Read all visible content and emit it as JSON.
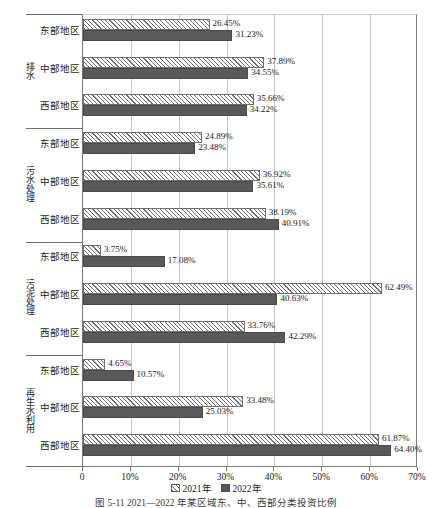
{
  "chart_data": {
    "type": "bar",
    "orientation": "horizontal",
    "title": "",
    "caption": "图 5-11  2021—2022 年某区域东、中、西部分类投资比例",
    "xlabel": "",
    "ylabel": "",
    "xlim": [
      0,
      70
    ],
    "xticks": [
      0,
      10,
      20,
      30,
      40,
      50,
      60,
      70
    ],
    "xtick_labels": [
      "0",
      "10%",
      "20%",
      "30%",
      "40%",
      "50%",
      "60%",
      "70%"
    ],
    "grid": true,
    "grid_axis": "x",
    "legend_position": "bottom",
    "legend": [
      "2021年",
      "2022年"
    ],
    "series": [
      {
        "name": "2021年",
        "fill": "hatched",
        "color": "#ffffff",
        "edge": "#6e6e6e"
      },
      {
        "name": "2022年",
        "fill": "solid",
        "color": "#595959",
        "edge": "#4a4a4a"
      }
    ],
    "groups": [
      {
        "label": "排水",
        "categories": [
          "东部地区",
          "中部地区",
          "西部地区"
        ],
        "values_2021": [
          26.45,
          37.89,
          35.66
        ],
        "values_2022": [
          31.23,
          34.55,
          34.22
        ],
        "labels_2021": [
          "26.45%",
          "37.89%",
          "35.66%"
        ],
        "labels_2022": [
          "31.23%",
          "34.55%",
          "34.22%"
        ]
      },
      {
        "label": "污水处理",
        "categories": [
          "东部地区",
          "中部地区",
          "西部地区"
        ],
        "values_2021": [
          24.89,
          36.92,
          38.19
        ],
        "values_2022": [
          23.48,
          35.61,
          40.91
        ],
        "labels_2021": [
          "24.89%",
          "36.92%",
          "38.19%"
        ],
        "labels_2022": [
          "23.48%",
          "35.61%",
          "40.91%"
        ]
      },
      {
        "label": "污泥处理",
        "categories": [
          "东部地区",
          "中部地区",
          "西部地区"
        ],
        "values_2021": [
          3.75,
          62.49,
          33.76
        ],
        "values_2022": [
          17.08,
          40.63,
          42.29
        ],
        "labels_2021": [
          "3.75%",
          "62.49%",
          "33.76%"
        ],
        "labels_2022": [
          "17.08%",
          "40.63%",
          "42.29%"
        ]
      },
      {
        "label": "再生水利用",
        "categories": [
          "东部地区",
          "中部地区",
          "西部地区"
        ],
        "values_2021": [
          4.65,
          33.48,
          61.87
        ],
        "values_2022": [
          10.57,
          25.03,
          64.4
        ],
        "labels_2021": [
          "4.65%",
          "33.48%",
          "61.87%"
        ],
        "labels_2022": [
          "10.57%",
          "25.03%",
          "64.40%"
        ]
      }
    ]
  }
}
